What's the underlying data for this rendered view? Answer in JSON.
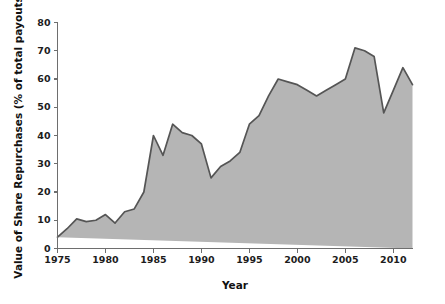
{
  "chart_data": {
    "type": "area",
    "title": "",
    "xlabel": "Year",
    "ylabel": "Value of Share Repurchases (% of total payouts)",
    "xlim": [
      1975,
      2012
    ],
    "ylim": [
      0,
      80
    ],
    "grid": false,
    "legend": null,
    "series_name": "Value of Share Repurchases",
    "area_fill_color": "#b5b5b5",
    "line_color": "#555555",
    "background_color": "#ffffff",
    "x": [
      1975,
      1976,
      1977,
      1978,
      1979,
      1980,
      1981,
      1982,
      1983,
      1984,
      1985,
      1986,
      1987,
      1988,
      1989,
      1990,
      1991,
      1992,
      1993,
      1994,
      1995,
      1996,
      1997,
      1998,
      1999,
      2000,
      2001,
      2002,
      2003,
      2004,
      2005,
      2006,
      2007,
      2008,
      2009,
      2010,
      2011,
      2012
    ],
    "values": [
      4,
      7,
      10.5,
      9.5,
      10,
      12,
      9,
      13,
      14,
      20,
      40,
      33,
      44,
      41,
      40,
      37,
      25,
      29,
      31,
      34,
      44,
      47,
      54,
      60,
      59,
      58,
      56,
      54,
      56,
      58,
      60,
      71,
      70,
      68,
      48,
      56,
      64,
      58
    ],
    "xticks": [
      1975,
      1980,
      1985,
      1990,
      1995,
      2000,
      2005,
      2010
    ],
    "xtick_labels": [
      "1975",
      "1980",
      "1985",
      "1990",
      "1995",
      "2000",
      "2005",
      "2010"
    ],
    "yticks": [
      0,
      10,
      20,
      30,
      40,
      50,
      60,
      70,
      80
    ],
    "ytick_labels": [
      "0",
      "10",
      "20",
      "30",
      "40",
      "50",
      "60",
      "70",
      "80"
    ]
  }
}
